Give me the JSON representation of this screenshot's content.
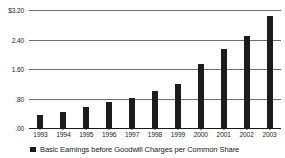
{
  "chart_data": {
    "type": "bar",
    "title": "",
    "subtitle": "",
    "xlabel": "",
    "ylabel": "",
    "categories": [
      "1993",
      "1994",
      "1995",
      "1996",
      "1997",
      "1998",
      "1999",
      "2000",
      "2001",
      "2002",
      "2003"
    ],
    "values": [
      0.35,
      0.44,
      0.57,
      0.7,
      0.82,
      1.0,
      1.2,
      1.73,
      2.13,
      2.5,
      3.05
    ],
    "series": [
      {
        "name": "Basic Earnings before Goodwill Charges per Common Share",
        "values": [
          0.35,
          0.44,
          0.57,
          0.7,
          0.82,
          1.0,
          1.2,
          1.73,
          2.13,
          2.5,
          3.05
        ],
        "color": "#1c1c1c"
      }
    ],
    "ylim": [
      0.0,
      3.2
    ],
    "yticks": [
      0.0,
      0.8,
      1.6,
      2.4,
      3.2
    ],
    "ytick_labels": [
      ".00",
      ".80",
      "1.60",
      "2.40",
      "$3.20"
    ],
    "grid": true,
    "grid_axis": "y",
    "legend": [
      {
        "label": "Basic Earnings before Goodwill Charges per Common Share",
        "color": "#1c1c1c",
        "marker": "square"
      }
    ],
    "legend_position": "bottom-left",
    "bar_color": "#1c1c1c",
    "gridline_color": "#6d6d6d",
    "axis_color": "#1a1a1a",
    "background_color": "#ffffff"
  }
}
